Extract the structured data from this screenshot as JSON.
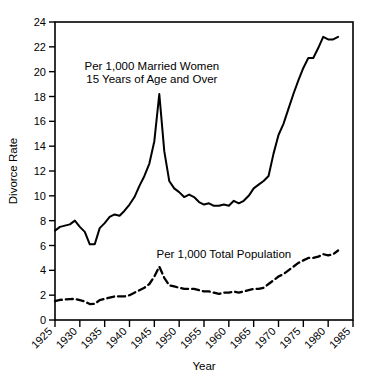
{
  "chart_data": {
    "type": "line",
    "title": "",
    "xlabel": "Year",
    "ylabel": "Divorce Rate",
    "xlim": [
      1925,
      1985
    ],
    "ylim": [
      0,
      24
    ],
    "grid": false,
    "legend_position": "inline-annotations",
    "xticks": [
      1925,
      1930,
      1935,
      1940,
      1945,
      1950,
      1955,
      1960,
      1965,
      1970,
      1975,
      1980,
      1985
    ],
    "xticklabels": [
      "1925",
      "1930",
      "1935",
      "1940",
      "1945",
      "1950",
      "1955",
      "1960",
      "1965",
      "1970",
      "1975",
      "1980",
      "1985"
    ],
    "yticks": [
      0,
      2,
      4,
      6,
      8,
      10,
      12,
      14,
      16,
      18,
      20,
      22,
      24
    ],
    "yticklabels": [
      "0",
      "2",
      "4",
      "6",
      "8",
      "10",
      "12",
      "14",
      "16",
      "18",
      "20",
      "22",
      "24"
    ],
    "annotations": [
      {
        "name": "married-women-annotation",
        "lines": [
          "Per 1,000 Married  Women",
          "15 Years of Age and  Over"
        ],
        "x": 1944.5,
        "y": 20.1
      },
      {
        "name": "total-population-annotation",
        "lines": [
          "Per 1,000 Total Population"
        ],
        "x": 1959.0,
        "y": 5.0
      }
    ],
    "series": [
      {
        "name": "Per 1,000 Married Women 15 Years of Age and Over",
        "style": "solid",
        "color": "#000000",
        "x": [
          1925,
          1926,
          1927,
          1928,
          1929,
          1930,
          1931,
          1932,
          1933,
          1934,
          1935,
          1936,
          1937,
          1938,
          1939,
          1940,
          1941,
          1942,
          1943,
          1944,
          1945,
          1946,
          1947,
          1948,
          1949,
          1950,
          1951,
          1952,
          1953,
          1954,
          1955,
          1956,
          1957,
          1958,
          1959,
          1960,
          1961,
          1962,
          1963,
          1964,
          1965,
          1966,
          1967,
          1968,
          1969,
          1970,
          1971,
          1972,
          1973,
          1974,
          1975,
          1976,
          1977,
          1978,
          1979,
          1980,
          1981,
          1982
        ],
        "values": [
          7.2,
          7.5,
          7.6,
          7.7,
          8.0,
          7.5,
          7.1,
          6.1,
          6.1,
          7.4,
          7.8,
          8.3,
          8.5,
          8.4,
          8.8,
          9.3,
          9.9,
          10.8,
          11.6,
          12.6,
          14.4,
          18.2,
          13.6,
          11.2,
          10.6,
          10.3,
          9.9,
          10.1,
          9.9,
          9.5,
          9.3,
          9.4,
          9.2,
          9.2,
          9.3,
          9.2,
          9.6,
          9.4,
          9.6,
          10.0,
          10.6,
          10.9,
          11.2,
          11.6,
          13.4,
          14.9,
          15.8,
          17.0,
          18.2,
          19.3,
          20.3,
          21.1,
          21.1,
          21.9,
          22.8,
          22.6,
          22.6,
          22.8
        ]
      },
      {
        "name": "Per 1,000 Total Population",
        "style": "dashed",
        "color": "#000000",
        "x": [
          1925,
          1926,
          1927,
          1928,
          1929,
          1930,
          1931,
          1932,
          1933,
          1934,
          1935,
          1936,
          1937,
          1938,
          1939,
          1940,
          1941,
          1942,
          1943,
          1944,
          1945,
          1946,
          1947,
          1948,
          1949,
          1950,
          1951,
          1952,
          1953,
          1954,
          1955,
          1956,
          1957,
          1958,
          1959,
          1960,
          1961,
          1962,
          1963,
          1964,
          1965,
          1966,
          1967,
          1968,
          1969,
          1970,
          1971,
          1972,
          1973,
          1974,
          1975,
          1976,
          1977,
          1978,
          1979,
          1980,
          1981,
          1982
        ],
        "values": [
          1.52,
          1.62,
          1.65,
          1.68,
          1.7,
          1.6,
          1.5,
          1.28,
          1.3,
          1.6,
          1.7,
          1.8,
          1.9,
          1.9,
          1.9,
          2.0,
          2.2,
          2.4,
          2.6,
          2.9,
          3.5,
          4.3,
          3.4,
          2.8,
          2.7,
          2.6,
          2.5,
          2.5,
          2.5,
          2.4,
          2.3,
          2.3,
          2.2,
          2.1,
          2.2,
          2.2,
          2.3,
          2.2,
          2.3,
          2.4,
          2.5,
          2.5,
          2.6,
          2.9,
          3.2,
          3.5,
          3.7,
          4.0,
          4.3,
          4.6,
          4.8,
          5.0,
          5.0,
          5.1,
          5.3,
          5.2,
          5.3,
          5.6
        ]
      }
    ]
  }
}
